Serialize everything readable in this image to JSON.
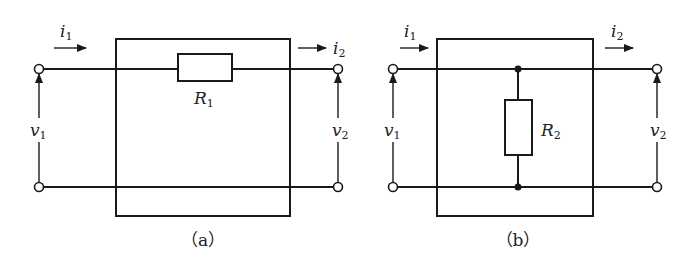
{
  "diagrams": [
    {
      "id": "a",
      "caption": "（a）",
      "resistor": {
        "symbol": "R",
        "subscript": "1",
        "connection": "series"
      },
      "current_in": {
        "symbol": "i",
        "subscript": "1"
      },
      "current_out": {
        "symbol": "i",
        "subscript": "2"
      },
      "voltage_in": {
        "symbol": "v",
        "subscript": "1"
      },
      "voltage_out": {
        "symbol": "v",
        "subscript": "2"
      }
    },
    {
      "id": "b",
      "caption": "（b）",
      "resistor": {
        "symbol": "R",
        "subscript": "2",
        "connection": "shunt"
      },
      "current_in": {
        "symbol": "i",
        "subscript": "1"
      },
      "current_out": {
        "symbol": "i",
        "subscript": "2"
      },
      "voltage_in": {
        "symbol": "v",
        "subscript": "1"
      },
      "voltage_out": {
        "symbol": "v",
        "subscript": "2"
      }
    }
  ],
  "colors": {
    "line": "#1a1a1a",
    "background": "#ffffff"
  }
}
